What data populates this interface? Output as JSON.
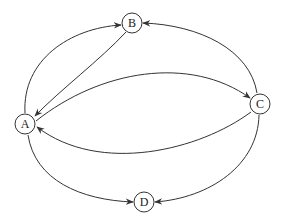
{
  "diagram": {
    "type": "directed-graph",
    "nodes": [
      {
        "id": "A",
        "label": "A"
      },
      {
        "id": "B",
        "label": "B"
      },
      {
        "id": "C",
        "label": "C"
      },
      {
        "id": "D",
        "label": "D"
      }
    ],
    "edges": [
      {
        "from": "A",
        "to": "B"
      },
      {
        "from": "B",
        "to": "A"
      },
      {
        "from": "C",
        "to": "B"
      },
      {
        "from": "A",
        "to": "C"
      },
      {
        "from": "C",
        "to": "A"
      },
      {
        "from": "A",
        "to": "D"
      },
      {
        "from": "C",
        "to": "D"
      }
    ],
    "colors": {
      "stroke": "#333333",
      "background": "#ffffff"
    }
  }
}
